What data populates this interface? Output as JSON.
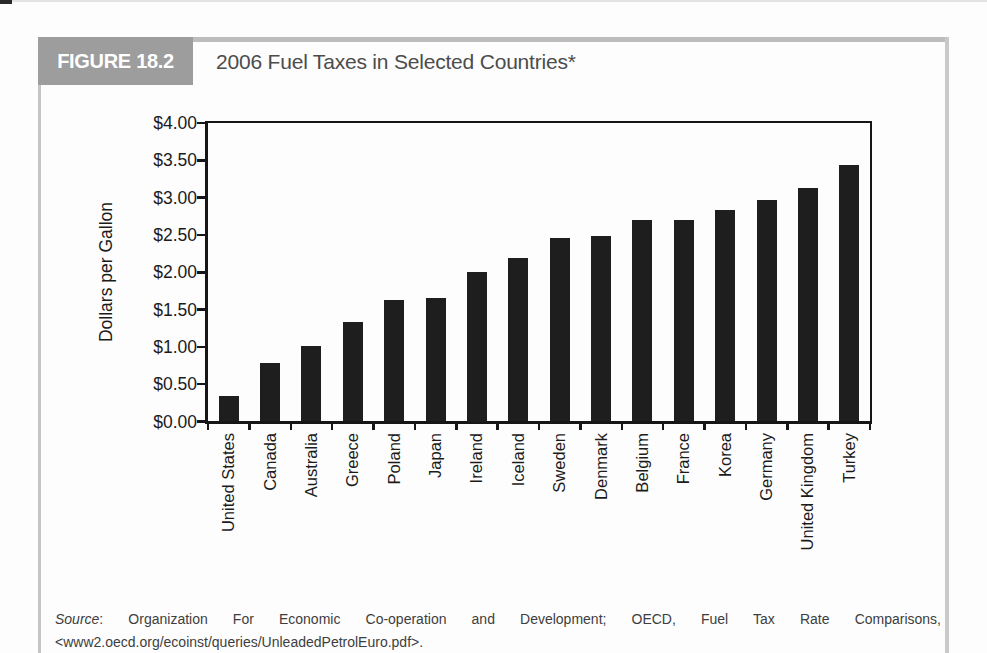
{
  "figure": {
    "tag": "FIGURE 18.2",
    "title": "2006 Fuel Taxes in Selected Countries*"
  },
  "chart_data": {
    "type": "bar",
    "title": "2006 Fuel Taxes in Selected Countries*",
    "categories": [
      "United States",
      "Canada",
      "Australia",
      "Greece",
      "Poland",
      "Japan",
      "Ireland",
      "Iceland",
      "Sweden",
      "Denmark",
      "Belgium",
      "France",
      "Korea",
      "Germany",
      "United Kingdom",
      "Turkey"
    ],
    "values": [
      0.34,
      0.78,
      1.01,
      1.34,
      1.63,
      1.66,
      2.0,
      2.19,
      2.46,
      2.48,
      2.7,
      2.7,
      2.83,
      2.97,
      3.13,
      3.44
    ],
    "xlabel": "",
    "ylabel": "Dollars per Gallon",
    "ylim": [
      0,
      4
    ],
    "ytick_step": 0.5,
    "ytick_labels": [
      "$0.00",
      "$0.50",
      "$1.00",
      "$1.50",
      "$2.00",
      "$2.50",
      "$3.00",
      "$3.50",
      "$4.00"
    ],
    "bar_color": "#1e1e1e",
    "grid": false,
    "legend": null
  },
  "source": {
    "label": "Source",
    "line1_rest": ": Organization For Economic Co-operation and Development; OECD, Fuel Tax Rate Comparisons,",
    "line2": "<www2.oecd.org/ecoinst/queries/UnleadedPetrolEuro.pdf>."
  }
}
